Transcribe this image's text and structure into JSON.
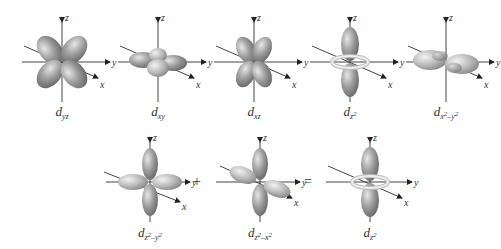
{
  "diagram": {
    "axis_labels": {
      "x": "x",
      "y": "y",
      "z": "z"
    },
    "colors": {
      "lobe": "#8a8a8a",
      "lobe_highlight": "#d9d9d9",
      "axis": "#333333",
      "torus": "#e8e8e8"
    },
    "top_row": [
      {
        "id": "dyz",
        "label_base": "d",
        "label_sub": "yz"
      },
      {
        "id": "dxy",
        "label_base": "d",
        "label_sub": "xy"
      },
      {
        "id": "dxz",
        "label_base": "d",
        "label_sub": "xz"
      },
      {
        "id": "dz2",
        "label_base": "d",
        "label_sub": "z",
        "label_sup": "2"
      },
      {
        "id": "dx2-y2",
        "label_base": "d",
        "label_sub": "x",
        "label_sup": "2",
        "label_sub2": "–y",
        "label_sup2": "2"
      }
    ],
    "bottom_row": [
      {
        "id": "dz2-y2",
        "label_base": "d",
        "label_sub": "z",
        "label_sup": "2",
        "label_sub2": "–y",
        "label_sup2": "2"
      },
      {
        "id": "dz2-x2",
        "label_base": "d",
        "label_sub": "z",
        "label_sup": "2",
        "label_sub2": "–x",
        "label_sup2": "2"
      },
      {
        "id": "dz2-result",
        "label_base": "d",
        "label_sub": "z",
        "label_sup": "2"
      }
    ],
    "operators": {
      "plus": "+",
      "equals": "="
    }
  }
}
